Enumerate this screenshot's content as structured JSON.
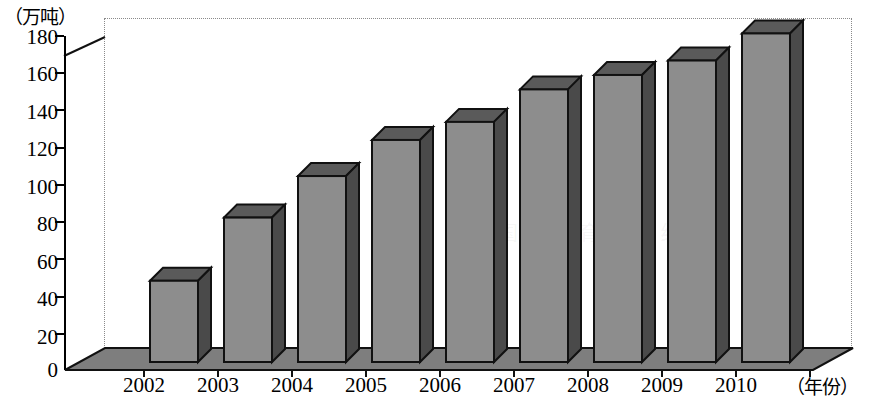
{
  "chart_data": {
    "type": "bar",
    "title": "",
    "subtitle": "",
    "xlabel": "（年份）",
    "ylabel": "（万吨）",
    "categories": [
      "2002",
      "2003",
      "2004",
      "2005",
      "2006",
      "2007",
      "2008",
      "2009",
      "2010"
    ],
    "values": [
      45,
      80,
      103,
      123,
      133,
      151,
      159,
      167,
      182
    ],
    "ylim": [
      0,
      190
    ],
    "yticks": [
      0,
      20,
      40,
      60,
      80,
      100,
      120,
      140,
      160,
      180
    ],
    "ytick_labels": [
      "0",
      "20",
      "40",
      "60",
      "80",
      "100",
      "120",
      "140",
      "160",
      "180"
    ],
    "grid": false,
    "legend": null,
    "legend_position": "none",
    "style": "3d-column",
    "bar_face_color": "#8d8d8d",
    "bar_side_color": "#4a4a4a",
    "bar_top_color": "#5a5a5a",
    "bar_outline_color": "#111111",
    "floor_color": "#7e7e7e",
    "background_color": "#ffffff",
    "axis_color": "#000000",
    "frame_color": "#8a8a8a"
  },
  "watermark": {
    "text": "中 国 教 育 在 线"
  }
}
